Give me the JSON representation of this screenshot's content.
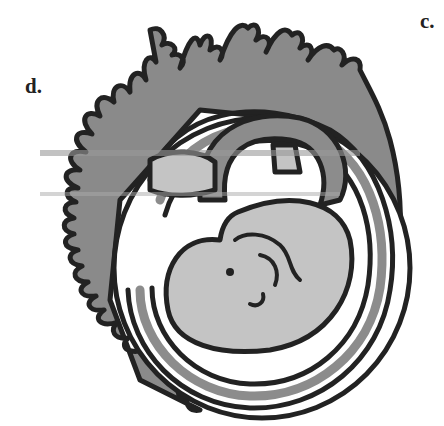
{
  "figure": {
    "type": "embryo-with-chorionic-villi",
    "labels": [
      {
        "id": "d",
        "text": "d."
      },
      {
        "id": "c",
        "text": "c."
      }
    ]
  },
  "colors": {
    "outline": "#222222",
    "chorion_fill": "#8a8a8a",
    "amnion_band": "#8c8c8c",
    "embryo_fill": "#c4c4c4",
    "background": "#ffffff"
  }
}
